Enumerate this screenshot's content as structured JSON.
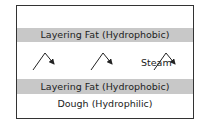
{
  "diagram": {
    "layers": [
      {
        "label": "Layering Fat (Hydrophobic)",
        "color": "#c8c8c8"
      },
      {
        "label": "Layering Fat (Hydrophobic)",
        "color": "#c8c8c8"
      },
      {
        "label": "Dough (Hydrophilic)",
        "color": "#ffffff"
      }
    ],
    "steam_label": "Steam",
    "arrow_count": 3
  }
}
